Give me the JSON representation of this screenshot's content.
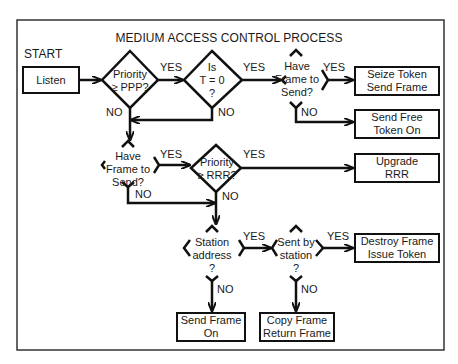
{
  "title": "MEDIUM ACCESS CONTROL PROCESS",
  "start_label": "START",
  "nodes": {
    "listen": "Listen",
    "priority_ppp": [
      "Priority",
      "≥ PPP?"
    ],
    "is_t0": [
      "Is",
      "T = 0",
      "?"
    ],
    "have_frame_1": [
      "Have",
      "Frame to",
      "Send?"
    ],
    "seize_token": [
      "Seize Token",
      "Send Frame"
    ],
    "send_free_token": [
      "Send Free",
      "Token On"
    ],
    "have_frame_2": [
      "Have",
      "Frame to",
      "Send?"
    ],
    "priority_rrr": [
      "Priority",
      "≥ RRR?"
    ],
    "upgrade_rrr": [
      "Upgrade",
      "RRR"
    ],
    "station_address": [
      "Station",
      "address",
      "?"
    ],
    "sent_by_station": [
      "Sent by",
      "station",
      "?"
    ],
    "destroy_frame": [
      "Destroy Frame",
      "Issue Token"
    ],
    "send_frame_on": [
      "Send Frame",
      "On"
    ],
    "copy_frame": [
      "Copy Frame",
      "Return Frame"
    ]
  },
  "edge_labels": {
    "yes": "YES",
    "no": "NO"
  },
  "colors": {
    "line": "#111111",
    "background": "#ffffff",
    "text": "#1a1a1a"
  }
}
